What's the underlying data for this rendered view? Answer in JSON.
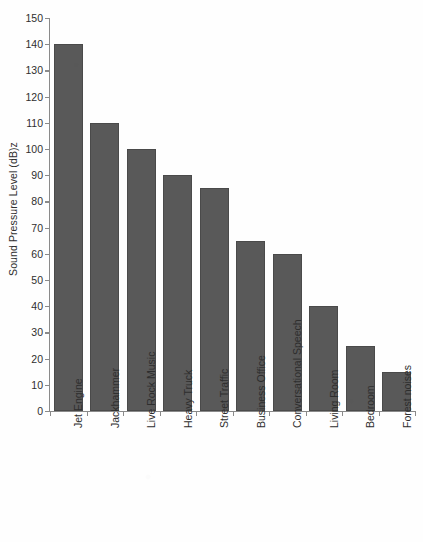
{
  "chart_data": {
    "type": "bar",
    "title": "",
    "xlabel": "",
    "ylabel": "Sound Pressure Level (dB)z",
    "ylim": [
      0,
      150
    ],
    "ytick_step": 10,
    "yticks": [
      0,
      10,
      20,
      30,
      40,
      50,
      60,
      70,
      80,
      90,
      100,
      110,
      120,
      130,
      140,
      150
    ],
    "ytick_labels": [
      "0",
      "10",
      "20",
      "30",
      "40",
      "50",
      "60",
      "70",
      "80",
      "90",
      "100",
      "110",
      "120",
      "130",
      "140",
      "150"
    ],
    "grid": false,
    "legend": null,
    "legend_position": "none",
    "bar_color": "#595959",
    "bar_edge_color": "#4a4a4a",
    "axis_color": "#8a8a8a",
    "background_color": "#ffffff",
    "xtick_label_rotation": 90,
    "categories": [
      "Jet Engine",
      "Jackhammer",
      "Live Rock Music",
      "Heavy Truck",
      "Street Traffic",
      "Business Office",
      "Conversational Speech",
      "Living Room",
      "Bedroom",
      "Forest noises"
    ],
    "values": [
      140,
      110,
      100,
      90,
      85,
      65,
      60,
      40,
      25,
      15
    ]
  }
}
